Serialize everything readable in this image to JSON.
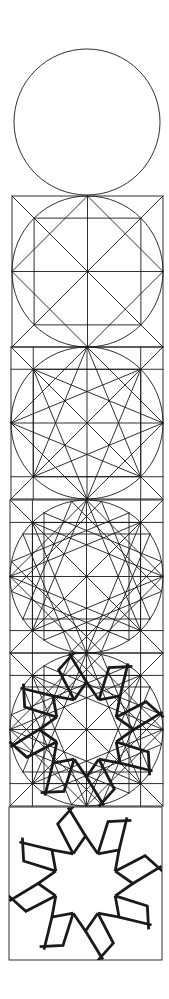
{
  "figure": {
    "stroke_color": "#1a1a1a",
    "thin_width": 0.9,
    "thick_width": 2.8,
    "center_x": 87,
    "top_circle": {
      "cx": 87,
      "cy": 122,
      "r": 73
    },
    "panels": [
      {
        "id": "panel-2",
        "stage": "square-diagonals",
        "y0": 196,
        "x0": 12,
        "x1": 163
      },
      {
        "id": "panel-3",
        "stage": "sixteen-point-lines",
        "y0": 347,
        "x0": 11,
        "x1": 163
      },
      {
        "id": "panel-4",
        "stage": "dense-construction",
        "y0": 500,
        "x0": 10,
        "x1": 163
      },
      {
        "id": "panel-5",
        "stage": "pattern-overlay",
        "y0": 653,
        "x0": 10,
        "x1": 163
      },
      {
        "id": "panel-6",
        "stage": "final-pattern",
        "y0": 807,
        "x0": 9,
        "x1": 162
      }
    ]
  }
}
